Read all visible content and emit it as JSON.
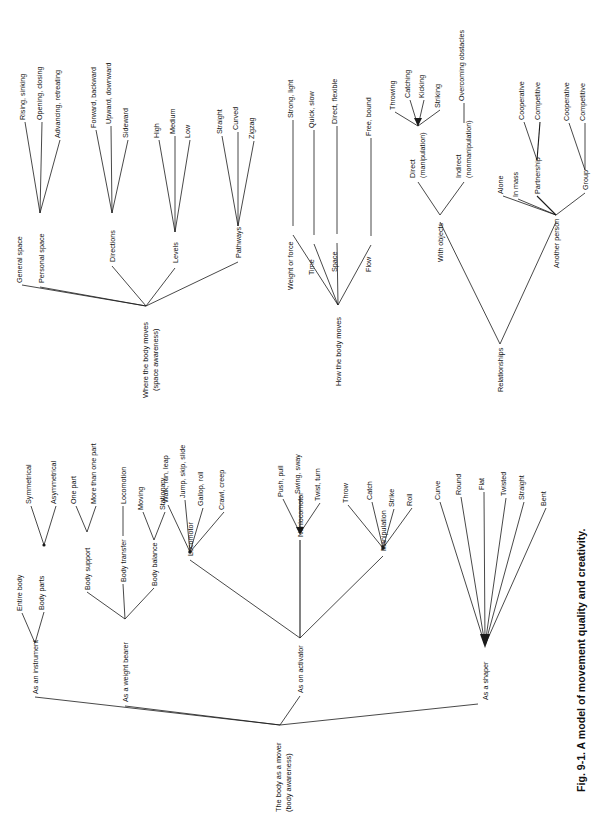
{
  "figure": {
    "caption": "Fig. 9-1. A model of movement quality and creativity.",
    "orientation": "rotated-90-ccw",
    "line_color": "#1a1a1a",
    "background": "#ffffff"
  },
  "trees": [
    {
      "id": "body-as-mover",
      "root": "The body as a mover\n(body awareness)",
      "root_line1": "The body as a mover",
      "root_line2": "(body awareness)",
      "branches": [
        {
          "label": "As an instrument",
          "children": [
            {
              "label": "Entire body",
              "children": []
            },
            {
              "label": "Body parts",
              "children": [
                {
                  "label": "Symmetrical"
                },
                {
                  "label": "Asymmetrical"
                }
              ]
            }
          ]
        },
        {
          "label": "As a weight bearer",
          "children": [
            {
              "label": "Body support",
              "children": [
                {
                  "label": "One part"
                },
                {
                  "label": "More than one part"
                }
              ]
            },
            {
              "label": "Body transfer",
              "children": [
                {
                  "label": "Locomotion"
                }
              ]
            },
            {
              "label": "Body balance",
              "children": [
                {
                  "label": "Moving"
                },
                {
                  "label": "Stationary"
                }
              ]
            }
          ]
        },
        {
          "label": "As on activator",
          "children": [
            {
              "label": "Locomotor",
              "children": [
                {
                  "label": "Walk, run, leap"
                },
                {
                  "label": "Jump, skip, slide"
                },
                {
                  "label": "Gallop, roll"
                },
                {
                  "label": "Crawl, creep"
                }
              ]
            },
            {
              "label": "Nonlocomotor",
              "children": [
                {
                  "label": "Push, pull"
                },
                {
                  "label": "Swing, sway"
                },
                {
                  "label": "Twist, turn"
                }
              ]
            },
            {
              "label": "Manipulation",
              "children": [
                {
                  "label": "Throw"
                },
                {
                  "label": "Catch"
                },
                {
                  "label": "Strike"
                },
                {
                  "label": "Roll"
                }
              ]
            }
          ]
        },
        {
          "label": "As a shaper",
          "children": [
            {
              "label": "Curve"
            },
            {
              "label": "Round"
            },
            {
              "label": "Flat"
            },
            {
              "label": "Twisted"
            },
            {
              "label": "Straight"
            },
            {
              "label": "Bent"
            }
          ]
        }
      ]
    },
    {
      "id": "where-the-body-moves",
      "root_line1": "Where the body moves",
      "root_line2": "(space awareness)",
      "branches": [
        {
          "label": "General space",
          "children": []
        },
        {
          "label": "Personal space",
          "children": [
            {
              "label": "Rising, sinking"
            },
            {
              "label": "Opening, closing"
            },
            {
              "label": "Advancing, retreating"
            }
          ]
        },
        {
          "label": "Directions",
          "children": [
            {
              "label": "Forward, backward"
            },
            {
              "label": "Upward, downward"
            },
            {
              "label": "Sideward"
            }
          ]
        },
        {
          "label": "Levels",
          "children": [
            {
              "label": "High"
            },
            {
              "label": "Medium"
            },
            {
              "label": "Low"
            }
          ]
        },
        {
          "label": "Pathways",
          "children": [
            {
              "label": "Straight"
            },
            {
              "label": "Curved"
            },
            {
              "label": "Zigzag"
            }
          ]
        }
      ]
    },
    {
      "id": "how-the-body-moves",
      "root_line1": "How the body moves",
      "root_line2": "",
      "branches": [
        {
          "label": "Weight or force",
          "children": [
            {
              "label": "Strong, light"
            }
          ]
        },
        {
          "label": "Time",
          "children": [
            {
              "label": "Quick, slow"
            }
          ]
        },
        {
          "label": "Space",
          "children": [
            {
              "label": "Direct, flexible"
            }
          ]
        },
        {
          "label": "Flow",
          "children": [
            {
              "label": "Free, bound"
            }
          ]
        }
      ]
    },
    {
      "id": "relationships",
      "root_line1": "Relationships",
      "root_line2": "",
      "branches": [
        {
          "label": "With objects",
          "children": [
            {
              "label": "Direct\n(manipulation)",
              "line1": "Direct",
              "line2": "(manipulation)",
              "children": [
                {
                  "label": "Throwing"
                },
                {
                  "label": "Catching"
                },
                {
                  "label": "Kicking"
                },
                {
                  "label": "Striking"
                }
              ]
            },
            {
              "label": "Indirect\n(nonmanipulation)",
              "line1": "Indirect",
              "line2": "(nonmanipulation)",
              "children": [
                {
                  "label": "Overcoming obstacles"
                }
              ]
            }
          ]
        },
        {
          "label": "Another person",
          "children": [
            {
              "label": "Alone"
            },
            {
              "label": "In mass"
            },
            {
              "label": "Partnership",
              "children": [
                {
                  "label": "Cooperative"
                },
                {
                  "label": "Competitive"
                }
              ]
            },
            {
              "label": "Group",
              "children": [
                {
                  "label": "Cooperative"
                },
                {
                  "label": "Competitive"
                }
              ]
            }
          ]
        }
      ]
    }
  ],
  "labels": {
    "general_space": "General space",
    "personal_space": "Personal space",
    "rising_sinking": "Rising, sinking",
    "opening_closing": "Opening, closing",
    "advancing_retreating": "Advancing, retreating",
    "directions": "Directions",
    "forward_backward": "Forward, backward",
    "upward_downward": "Upward, downward",
    "sideward": "Sideward",
    "levels": "Levels",
    "high": "High",
    "medium": "Medium",
    "low": "Low",
    "pathways": "Pathways",
    "straight": "Straight",
    "curved": "Curved",
    "zigzag": "Zigzag",
    "where_body_moves_1": "Where the body moves",
    "where_body_moves_2": "(space awareness)",
    "weight_or_force": "Weight or force",
    "strong_light": "Strong, light",
    "time": "Time",
    "quick_slow": "Quick, slow",
    "space": "Space",
    "direct_flexible": "Direct, flexible",
    "flow": "Flow",
    "free_bound": "Free, bound",
    "how_body_moves": "How the body moves",
    "relationships": "Relationships",
    "with_objects": "With objects",
    "another_person": "Another person",
    "direct_1": "Direct",
    "direct_2": "(manipulation)",
    "indirect_1": "Indirect",
    "indirect_2": "(nonmanipulation)",
    "throwing": "Throwing",
    "catching": "Catching",
    "kicking": "Kicking",
    "striking": "Striking",
    "overcoming_obstacles": "Overcoming obstacles",
    "alone": "Alone",
    "in_mass": "In mass",
    "partnership": "Partnership",
    "group": "Group",
    "coop_p": "Cooperative",
    "comp_p": "Competitive",
    "coop_g": "Cooperative",
    "comp_g": "Competitive",
    "the_body_mover_1": "The body as a mover",
    "the_body_mover_2": "(body awareness)",
    "as_an_instrument": "As an instrument",
    "entire_body": "Entire body",
    "body_parts": "Body parts",
    "symmetrical": "Symmetrical",
    "asymmetrical": "Asymmetrical",
    "as_a_weight_bearer": "As a weight bearer",
    "body_support": "Body support",
    "one_part": "One part",
    "more_than_one_part": "More than one part",
    "body_transfer": "Body transfer",
    "locomotion": "Locomotion",
    "body_balance": "Body balance",
    "moving": "Moving",
    "stationary": "Stationary",
    "as_on_activator": "As on activator",
    "locomotor": "Locomotor",
    "walk_run_leap": "Walk, run, leap",
    "jump_skip_slide": "Jump, skip, slide",
    "gallop_roll": "Gallop, roll",
    "crawl_creep": "Crawl, creep",
    "nonlocomotor": "Nonlocomotor",
    "push_pull": "Push, pull",
    "swing_sway": "Swing, sway",
    "twist_turn": "Twist, turn",
    "manipulation": "Manipulation",
    "throw": "Throw",
    "catch": "Catch",
    "strike": "Strike",
    "roll": "Roll",
    "as_a_shaper": "As a shaper",
    "curve": "Curve",
    "round": "Round",
    "flat": "Flat",
    "twisted": "Twisted",
    "straight2": "Straight",
    "bent": "Bent",
    "caption": "Fig. 9-1. A model of movement quality and creativity."
  }
}
